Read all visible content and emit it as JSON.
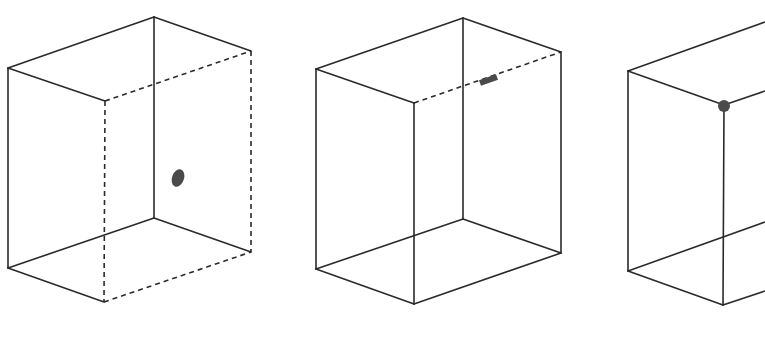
{
  "figure": {
    "colors": {
      "line": "#2a2a2a",
      "marker": "#4a4a4a",
      "background": "#ffffff"
    },
    "panels": [
      {
        "id": "box-1",
        "highlight": "face",
        "highlight_label": "point on right face",
        "marker_shape": "ellipse",
        "vertices": {
          "top_left": [
            8,
            68
          ],
          "top_back": [
            154,
            17
          ],
          "top_front": [
            105,
            101
          ],
          "top_right": [
            251,
            51
          ],
          "bottom_left": [
            8,
            268
          ],
          "bottom_back": [
            154,
            218
          ],
          "bottom_front": [
            104,
            302
          ],
          "bottom_right": [
            251,
            252
          ]
        },
        "marker": {
          "cx": 178,
          "cy": 178,
          "rx": 6,
          "ry": 9,
          "rotate": 20
        },
        "dashed_edges": [
          "top_front-top_right",
          "top_right-bottom_right",
          "top_front-bottom_front",
          "bottom_front-bottom_right"
        ]
      },
      {
        "id": "box-2",
        "highlight": "edge",
        "highlight_label": "point on top edge",
        "marker_shape": "bar",
        "vertices": {
          "top_left": [
            316,
            69
          ],
          "top_back": [
            463,
            18
          ],
          "top_front": [
            414,
            103
          ],
          "top_right": [
            561,
            52
          ],
          "bottom_left": [
            316,
            269
          ],
          "bottom_back": [
            463,
            219
          ],
          "bottom_front": [
            414,
            304
          ],
          "bottom_right": [
            561,
            253
          ]
        },
        "marker": {
          "x1": 480,
          "y1": 83,
          "x2": 497,
          "y2": 77
        },
        "dashed_edges": [
          "top_front-top_right"
        ]
      },
      {
        "id": "box-3",
        "highlight": "vertex",
        "highlight_label": "point at corner",
        "marker_shape": "circle",
        "vertices": {
          "top_left": [
            628,
            71
          ],
          "top_back_cut": [
            765,
            22
          ],
          "top_front": [
            724,
            105
          ],
          "top_right_cut": [
            765,
            91
          ],
          "bottom_left": [
            628,
            271
          ],
          "bottom_back_cut": [
            765,
            222
          ],
          "bottom_front": [
            723,
            305
          ],
          "bottom_right_cut": [
            765,
            291
          ]
        },
        "marker": {
          "cx": 724,
          "cy": 106,
          "r": 6
        },
        "dashed_edges": []
      }
    ],
    "captions": [
      "",
      "",
      ""
    ]
  }
}
